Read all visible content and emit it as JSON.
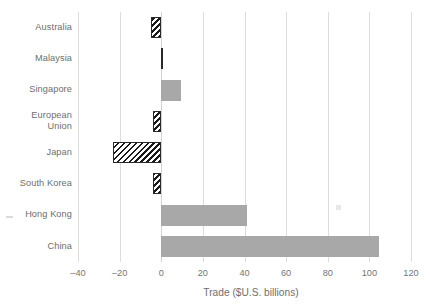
{
  "chart_data": {
    "type": "bar",
    "orientation": "horizontal",
    "title": "",
    "subtitle": "",
    "xlabel": "Trade ($U.S. billions)",
    "ylabel": "",
    "xlim": [
      -40,
      120
    ],
    "xticks": [
      -40,
      -20,
      0,
      20,
      40,
      60,
      80,
      100,
      120
    ],
    "xticklabels": [
      "–40",
      "–20",
      "0",
      "20",
      "40",
      "60",
      "80",
      "100",
      "120"
    ],
    "grid": "vertical",
    "legend": "none",
    "categories": [
      "Australia",
      "Malaysia",
      "Singapore",
      "European\nUnion",
      "Japan",
      "South Korea",
      "Hong Kong",
      "China"
    ],
    "values": [
      -5.0,
      -0.3,
      9.5,
      -4.2,
      -23.0,
      -4.0,
      41.0,
      104.5
    ],
    "series": [
      {
        "name": "Trade",
        "values": [
          -5.0,
          -0.3,
          9.5,
          -4.2,
          -23.0,
          -4.0,
          41.0,
          104.5
        ]
      }
    ],
    "styles": {
      "positive_fill": "#a8a8a8",
      "negative_fill": "hatched-black-diagonal",
      "gridline_color": "#dcdcdc",
      "text_color": "#6e6e6e"
    },
    "points": [
      {
        "category": "Australia",
        "value": -5.0,
        "style": "hatched"
      },
      {
        "category": "Malaysia",
        "value": -0.3,
        "style": "hatched"
      },
      {
        "category": "Singapore",
        "value": 9.5,
        "style": "solid"
      },
      {
        "category": "European Union",
        "value": -4.2,
        "style": "hatched"
      },
      {
        "category": "Japan",
        "value": -23.0,
        "style": "hatched"
      },
      {
        "category": "South Korea",
        "value": -4.0,
        "style": "hatched"
      },
      {
        "category": "Hong Kong",
        "value": 41.0,
        "style": "solid"
      },
      {
        "category": "China",
        "value": 104.5,
        "style": "solid"
      }
    ]
  }
}
